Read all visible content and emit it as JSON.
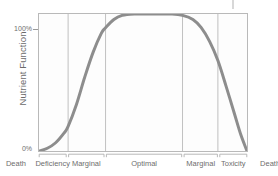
{
  "chart_data": {
    "type": "line",
    "title": "",
    "subtitle": "",
    "xlabel": "",
    "ylabel": "Nutrient Function",
    "ylim": [
      0,
      100
    ],
    "y_tick_labels": [
      "0%",
      "100%"
    ],
    "y_ticks": [
      0,
      100
    ],
    "grid": false,
    "legend": "none",
    "x_categories": [
      "Death",
      "Deficiency",
      "Marginal",
      "Optimal",
      "Marginal",
      "Toxicity",
      "Death"
    ],
    "region_boundaries_pct": [
      0,
      14,
      32,
      69,
      86,
      100
    ],
    "annotations": [
      "Curve rises from 0% at minimum intake through deficiency and marginal ranges, plateaus at 100% across the optimal range, then falls back to 0% through marginal and toxicity ranges."
    ],
    "series": [
      {
        "name": "Nutrient Function",
        "color": "#8d8d8d",
        "x": [
          0,
          4,
          8,
          12,
          14,
          18,
          22,
          26,
          30,
          32,
          36,
          40,
          46,
          52,
          58,
          64,
          69,
          74,
          78,
          82,
          86,
          90,
          94,
          97,
          100
        ],
        "values": [
          0,
          2,
          6,
          13,
          18,
          34,
          54,
          72,
          86,
          90,
          96,
          99,
          100,
          100,
          100,
          100,
          99,
          96,
          90,
          80,
          66,
          47,
          27,
          12,
          0
        ]
      }
    ]
  },
  "axis": {
    "y_title": "Nutrient Function",
    "y_max_label": "100%",
    "y_min_label": "0%"
  },
  "x_axis_labels": [
    {
      "text": "Death",
      "pos_pct": -10.5
    },
    {
      "text": "Deficiency",
      "pos_pct": 7.0
    },
    {
      "text": "Marginal",
      "pos_pct": 23.0
    },
    {
      "text": "Optimal",
      "pos_pct": 50.5
    },
    {
      "text": "Marginal",
      "pos_pct": 77.5
    },
    {
      "text": "Toxicity",
      "pos_pct": 93.0
    },
    {
      "text": "Death",
      "pos_pct": 110.5
    }
  ],
  "colors": {
    "curve": "#8d8d8d",
    "frame": "#b9b9b9",
    "divider": "#b0b0b0",
    "text": "#6e6e6e",
    "plot_background": "#fdfdfd"
  }
}
